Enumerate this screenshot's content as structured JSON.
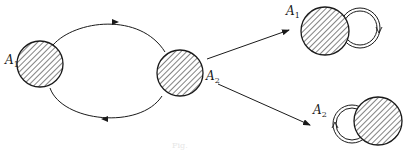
{
  "diagram": {
    "colors": {
      "stroke": "#1a1a1a",
      "background": "#ffffff",
      "hatch": "#1a1a1a"
    },
    "labels": {
      "a1_left": {
        "main": "A",
        "sub": "1"
      },
      "a2_center": {
        "main": "A",
        "sub": "2"
      },
      "a1_right": {
        "main": "A",
        "sub": "1"
      },
      "a2_right": {
        "main": "A",
        "sub": "2"
      }
    },
    "caption": "Fig."
  }
}
